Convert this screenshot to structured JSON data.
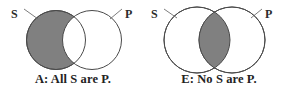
{
  "figure": {
    "type": "venn-diagram-pair",
    "background_color": "#ffffff",
    "shade_color": "#808080",
    "outline_color": "#4a4a4a",
    "text_color": "#232323",
    "panels": [
      {
        "id": "A",
        "caption": "A: All S are P.",
        "subject_label": "S",
        "predicate_label": "P",
        "shaded_region": "subject-circle-entirely",
        "shaded_region_description": "The whole S circle is shaded"
      },
      {
        "id": "E",
        "caption": "E: No S are P.",
        "subject_label": "S",
        "predicate_label": "P",
        "shaded_region": "intersection-lens",
        "shaded_region_description": "Only the overlap of S and P is shaded"
      }
    ]
  }
}
